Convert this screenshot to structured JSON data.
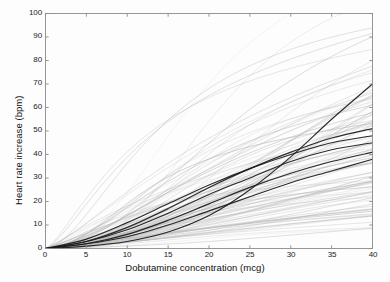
{
  "chart_data": {
    "type": "line",
    "title": "",
    "xlabel": "Dobutamine concentration (mcg)",
    "ylabel": "Heart rate increase (bpm)",
    "xlim": [
      0,
      40
    ],
    "ylim": [
      0,
      100
    ],
    "xticks": [
      0,
      5,
      10,
      15,
      20,
      25,
      30,
      35,
      40
    ],
    "yticks": [
      0,
      10,
      20,
      30,
      40,
      50,
      60,
      70,
      80,
      90,
      100
    ],
    "grid": false,
    "legend": null,
    "x": [
      0,
      5,
      10,
      15,
      20,
      25,
      30,
      35,
      40
    ],
    "series": [
      {
        "name": "highlighted-subject-1",
        "style": "bold",
        "color": "#1a1a1a",
        "values": [
          0,
          1,
          3,
          7,
          14,
          25,
          39,
          55,
          70
        ]
      },
      {
        "name": "highlighted-subject-2",
        "style": "bold",
        "color": "#1a1a1a",
        "values": [
          0,
          3,
          9,
          17,
          26,
          34,
          41,
          47,
          51
        ]
      },
      {
        "name": "highlighted-subject-3",
        "style": "bold",
        "color": "#1a1a1a",
        "values": [
          0,
          4,
          11,
          19,
          27,
          34,
          40,
          45,
          48
        ]
      },
      {
        "name": "highlighted-subject-4",
        "style": "bold",
        "color": "#1a1a1a",
        "values": [
          0,
          3,
          8,
          15,
          23,
          30,
          37,
          42,
          45
        ]
      },
      {
        "name": "highlighted-subject-5",
        "style": "bold",
        "color": "#1a1a1a",
        "values": [
          0,
          2,
          6,
          12,
          19,
          26,
          32,
          37,
          41
        ]
      },
      {
        "name": "highlighted-subject-6",
        "style": "bold",
        "color": "#1a1a1a",
        "values": [
          0,
          2,
          5,
          10,
          16,
          22,
          28,
          33,
          38
        ]
      },
      {
        "name": "population-curves",
        "style": "faint",
        "color": "#b9b9b9",
        "count": 98,
        "description": "Dense fan of individual subject dose-response curves, sigmoidal, all originating at the origin and spreading to 5-100 bpm at 40 mcg"
      }
    ],
    "annotations": []
  },
  "axes": {
    "x_tick_labels": [
      "0",
      "5",
      "10",
      "15",
      "20",
      "25",
      "30",
      "35",
      "40"
    ],
    "y_tick_labels": [
      "0",
      "10",
      "20",
      "30",
      "40",
      "50",
      "60",
      "70",
      "80",
      "90",
      "100"
    ],
    "x_axis_label": "Dobutamine concentration (mcg)",
    "y_axis_label": "Heart rate increase (bpm)",
    "frame_color": "#8c8c8c"
  }
}
